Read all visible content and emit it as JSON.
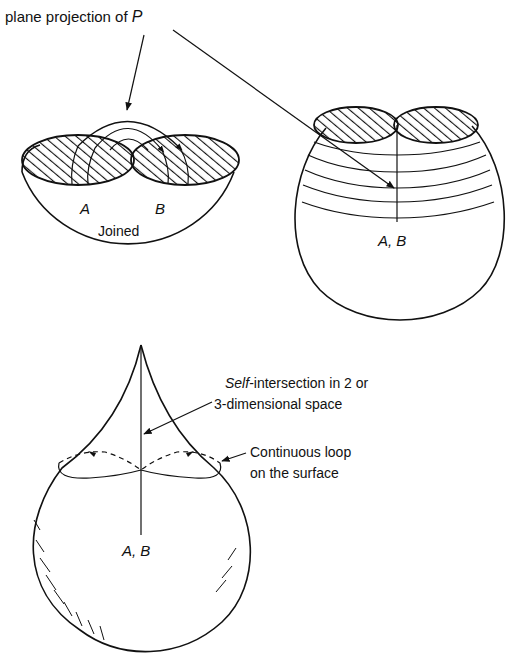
{
  "labels": {
    "title_prefix": "plane projection of ",
    "title_var": "P",
    "point_a": "A",
    "point_b": "B",
    "joined": "Joined",
    "ab_top_right": "A, B",
    "ab_bottom": "A, B",
    "self_int_italic": "Self",
    "self_int_rest": "-intersection in 2 or",
    "self_int_line2": "3-dimensional space",
    "loop_line1": "Continuous loop",
    "loop_line2": "on the surface"
  },
  "colors": {
    "ink": "#111111",
    "background": "#ffffff"
  },
  "figures": [
    {
      "name": "hemisphere-joined",
      "description": "Hemisphere with two hatched discs A and B joined by arcs"
    },
    {
      "name": "sphere-nested-arcs",
      "description": "Sphere with two hatched caps and nested arcs meeting at A,B"
    },
    {
      "name": "pinched-sphere",
      "description": "Teardrop surface with self-intersection line and continuous loop"
    }
  ]
}
